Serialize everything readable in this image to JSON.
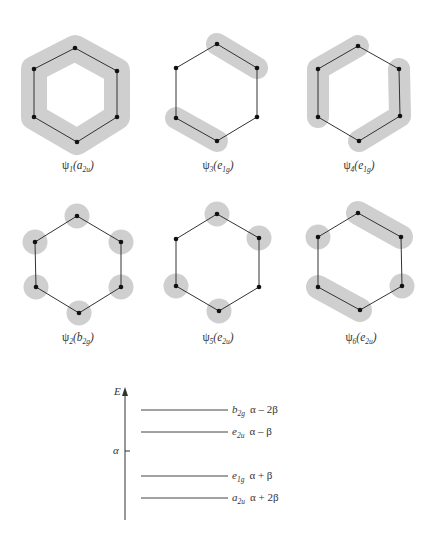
{
  "figure": {
    "shade_color": "#cfcfcf",
    "bond_color": "#333333",
    "atom_color": "#111111"
  },
  "orbitals": [
    {
      "id": "psi1",
      "label_psi": "ψ",
      "label_index": "1",
      "label_symmetry": "a",
      "label_symmetry_sub": "2u",
      "shading": "full ring (all six p-orbitals in phase)"
    },
    {
      "id": "psi3",
      "label_psi": "ψ",
      "label_index": "3",
      "label_symmetry": "e",
      "label_symmetry_sub": "1g",
      "shading": "two opposite bonds (top-right, bottom-left)"
    },
    {
      "id": "psi4",
      "label_psi": "ψ",
      "label_index": "4",
      "label_symmetry": "e",
      "label_symmetry_sub": "1g",
      "shading": "two three-atom segments (left, right)"
    },
    {
      "id": "psi2",
      "label_psi": "ψ",
      "label_index": "2",
      "label_symmetry": "b",
      "label_symmetry_sub": "2g",
      "shading": "six separate atoms"
    },
    {
      "id": "psi5",
      "label_psi": "ψ",
      "label_index": "5",
      "label_symmetry": "e",
      "label_symmetry_sub": "2u",
      "shading": "four separate atoms"
    },
    {
      "id": "psi6",
      "label_psi": "ψ",
      "label_index": "6",
      "label_symmetry": "e",
      "label_symmetry_sub": "2u",
      "shading": "two bonds and two single atoms"
    }
  ],
  "energy_diagram": {
    "axis_label": "E",
    "reference_label": "α",
    "levels": [
      {
        "symmetry": "b",
        "symmetry_sub": "2g",
        "energy": "α – 2β"
      },
      {
        "symmetry": "e",
        "symmetry_sub": "2u",
        "energy": "α – β"
      },
      {
        "symmetry": "e",
        "symmetry_sub": "1g",
        "energy": "α + β"
      },
      {
        "symmetry": "a",
        "symmetry_sub": "2u",
        "energy": "α + 2β"
      }
    ]
  }
}
